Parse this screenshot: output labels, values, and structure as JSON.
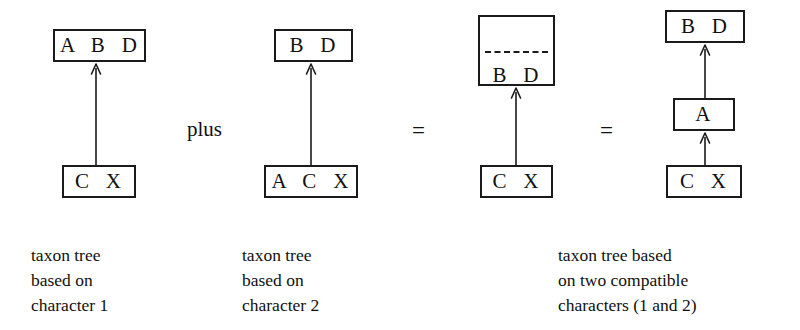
{
  "figure": {
    "background_color": "#ffffff",
    "stroke_color": "#1a1a1a",
    "text_color": "#101010"
  },
  "operators": {
    "plus_label": "plus",
    "equals_first": "=",
    "equals_second": "="
  },
  "trees": [
    {
      "id": "tree-character-1",
      "boxes": [
        {
          "id": "tree1-top-box",
          "label": "A  B  D"
        },
        {
          "id": "tree1-bottom-box",
          "label": "C  X"
        }
      ],
      "caption": "taxon tree\nbased on\ncharacter 1"
    },
    {
      "id": "tree-character-2",
      "boxes": [
        {
          "id": "tree2-top-box",
          "label": "B  D"
        },
        {
          "id": "tree2-bottom-box",
          "label": "A  C  X"
        }
      ],
      "caption": "taxon tree\nbased on\ncharacter 2"
    },
    {
      "id": "tree-combined-split",
      "boxes": [
        {
          "id": "tree3-top-box-upper",
          "label": "B  D"
        },
        {
          "id": "tree3-top-box-lower",
          "label": "A"
        },
        {
          "id": "tree3-bottom-box",
          "label": "C  X"
        }
      ],
      "caption": ""
    },
    {
      "id": "tree-combined-resolved",
      "boxes": [
        {
          "id": "tree4-top-box",
          "label": "B  D"
        },
        {
          "id": "tree4-middle-box",
          "label": "A"
        },
        {
          "id": "tree4-bottom-box",
          "label": "C  X"
        }
      ],
      "caption": "taxon tree based\non two compatible\ncharacters (1 and 2)"
    }
  ]
}
